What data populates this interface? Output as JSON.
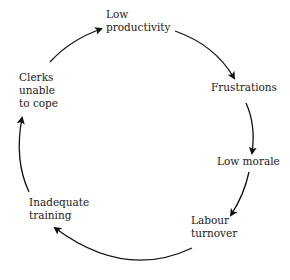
{
  "diagram": {
    "type": "cycle",
    "nodes": [
      {
        "id": "low_productivity",
        "label": "Low\nproductivity"
      },
      {
        "id": "frustrations",
        "label": "Frustrations"
      },
      {
        "id": "low_morale",
        "label": "Low morale"
      },
      {
        "id": "labour_turnover",
        "label": "Labour\nturnover"
      },
      {
        "id": "inadequate_training",
        "label": "Inadequate\ntraining"
      },
      {
        "id": "clerks_unable",
        "label": "Clerks\nunable\nto cope"
      }
    ],
    "edges": [
      {
        "from": "low_productivity",
        "to": "frustrations"
      },
      {
        "from": "frustrations",
        "to": "low_morale"
      },
      {
        "from": "low_morale",
        "to": "labour_turnover"
      },
      {
        "from": "labour_turnover",
        "to": "inadequate_training"
      },
      {
        "from": "inadequate_training",
        "to": "clerks_unable"
      },
      {
        "from": "clerks_unable",
        "to": "low_productivity"
      }
    ]
  }
}
